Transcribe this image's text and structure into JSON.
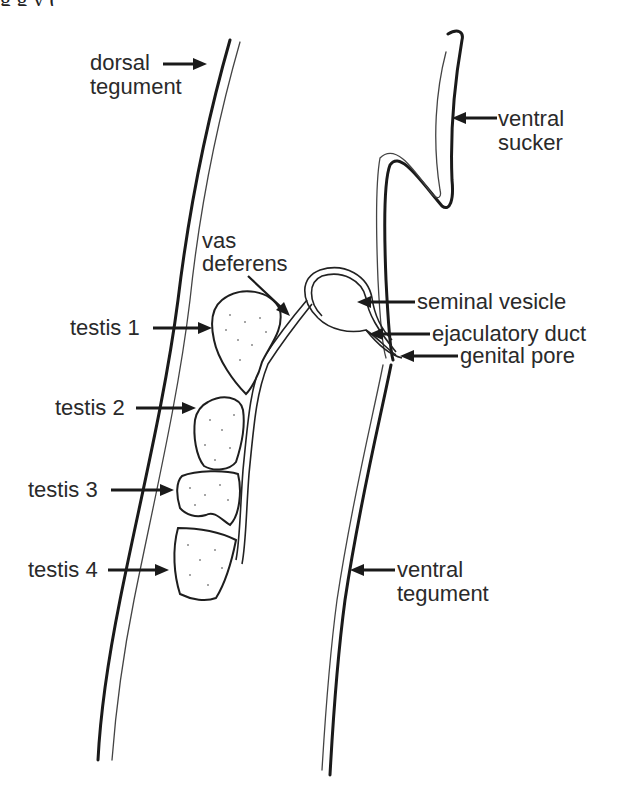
{
  "figure": {
    "type": "anatomical diagram",
    "clipped_top_text": "g   g                                         y   ("
  },
  "labels": {
    "dorsal_tegument": [
      "dorsal",
      "tegument"
    ],
    "ventral_sucker": [
      "ventral",
      "sucker"
    ],
    "vas_deferens": [
      "vas",
      "deferens"
    ],
    "seminal_vesicle": "seminal vesicle",
    "ejaculatory_duct": "ejaculatory duct",
    "genital_pore": "genital pore",
    "testis_1": "testis 1",
    "testis_2": "testis 2",
    "testis_3": "testis 3",
    "testis_4": "testis 4",
    "ventral_tegument": [
      "ventral",
      "tegument"
    ]
  },
  "colors": {
    "ink": "#1a1a1a",
    "background": "#ffffff"
  }
}
